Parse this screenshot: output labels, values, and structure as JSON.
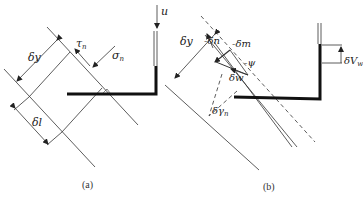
{
  "figure": {
    "panels": [
      {
        "id": "a",
        "caption": "(a)",
        "labels": {
          "delta_y": "δy",
          "delta_l": "δl",
          "tau": "τ",
          "tau_sub": "n",
          "sigma": "σ",
          "sigma_sub": "n",
          "u": "u"
        }
      },
      {
        "id": "b",
        "caption": "(b)",
        "labels": {
          "delta_y": "δy",
          "delta_n": "-δn",
          "delta_m": "-δm",
          "psi": "-ψ",
          "delta_w": "δw",
          "delta_gamma": "δγ",
          "delta_gamma_sub": "n",
          "delta_V": "δV",
          "delta_V_sub": "w"
        }
      }
    ],
    "colors": {
      "line": "#333333",
      "background": "#ffffff"
    }
  }
}
